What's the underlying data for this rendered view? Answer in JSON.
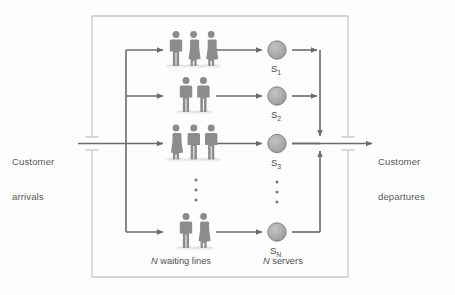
{
  "figure": {
    "type": "queueing-system-diagram",
    "title_visible": false,
    "colors": {
      "frame": "#c9c9c9",
      "flow_line": "#6b6b6b",
      "person": "#8c8c8c",
      "server_fill": "#aaaaaa",
      "server_stroke": "#7d7d7d",
      "text": "#4f4f4f",
      "background": "#fdfdfd"
    }
  },
  "labels": {
    "arrivals_line1": "Customer",
    "arrivals_line2": "arrivals",
    "departures_line1": "Customer",
    "departures_line2": "departures"
  },
  "captions": {
    "waiting_lines_n": "N",
    "waiting_lines_text": " waiting lines",
    "servers_n": "N",
    "servers_text": " servers"
  },
  "queues": [
    {
      "id": "queue-1",
      "people": 3,
      "genders": [
        "male",
        "female",
        "female"
      ],
      "y": 50
    },
    {
      "id": "queue-2",
      "people": 2,
      "genders": [
        "male",
        "male"
      ],
      "y": 96
    },
    {
      "id": "queue-3",
      "people": 3,
      "genders": [
        "female",
        "male",
        "male"
      ],
      "y": 143
    },
    {
      "id": "queue-n",
      "people": 2,
      "genders": [
        "male",
        "female"
      ],
      "y": 232
    }
  ],
  "servers": [
    {
      "id": "server-1",
      "label": "S",
      "sub": "1",
      "cx": 277,
      "cy": 50
    },
    {
      "id": "server-2",
      "label": "S",
      "sub": "2",
      "cx": 277,
      "cy": 96
    },
    {
      "id": "server-3",
      "label": "S",
      "sub": "3",
      "cx": 277,
      "cy": 143
    },
    {
      "id": "server-n",
      "label": "S",
      "sub": "N",
      "cx": 277,
      "cy": 232
    }
  ],
  "ellipsis": {
    "queues_dots": 3,
    "servers_dots": 3
  },
  "system_boundary": {
    "left": 92,
    "top": 16,
    "right": 348,
    "bottom": 277
  }
}
